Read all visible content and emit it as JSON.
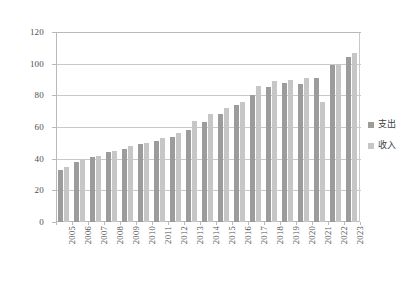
{
  "chart_data": {
    "type": "bar",
    "title": "",
    "subtitle": "",
    "xlabel": "",
    "ylabel": "",
    "ylim": [
      0,
      120
    ],
    "ytick_step": 20,
    "yticks": [
      0,
      20,
      40,
      60,
      80,
      100,
      120
    ],
    "ytick_labels": [
      "0",
      "20",
      "40",
      "60",
      "80",
      "100",
      "120"
    ],
    "grid": true,
    "grid_axis": "y",
    "legend_position": "right",
    "categories": [
      "2005",
      "2006",
      "2007",
      "2008",
      "2009",
      "2010",
      "2011",
      "2012",
      "2013",
      "2014",
      "2015",
      "2016",
      "2017",
      "2018",
      "2019",
      "2020",
      "2021",
      "2022",
      "2023"
    ],
    "series": [
      {
        "name": "支出",
        "color": "#9c9c9c",
        "values": [
          33,
          38,
          41,
          44,
          46,
          49,
          51,
          54,
          58,
          63,
          68,
          74,
          80,
          85,
          88,
          87,
          91,
          99,
          104
        ]
      },
      {
        "name": "收入",
        "color": "#c6c6c6",
        "values": [
          35,
          39,
          42,
          45,
          48,
          50,
          53,
          56,
          64,
          68,
          72,
          76,
          86,
          89,
          90,
          91,
          76,
          100,
          107
        ]
      }
    ]
  },
  "legend": {
    "items": [
      {
        "label": "支出",
        "color": "#9c9c9c"
      },
      {
        "label": "收入",
        "color": "#c6c6c6"
      }
    ]
  },
  "axes": {
    "y_axis_color": "#b9b9b9",
    "grid_color": "#c9c9c9",
    "text_color": "#4f4f4f"
  }
}
